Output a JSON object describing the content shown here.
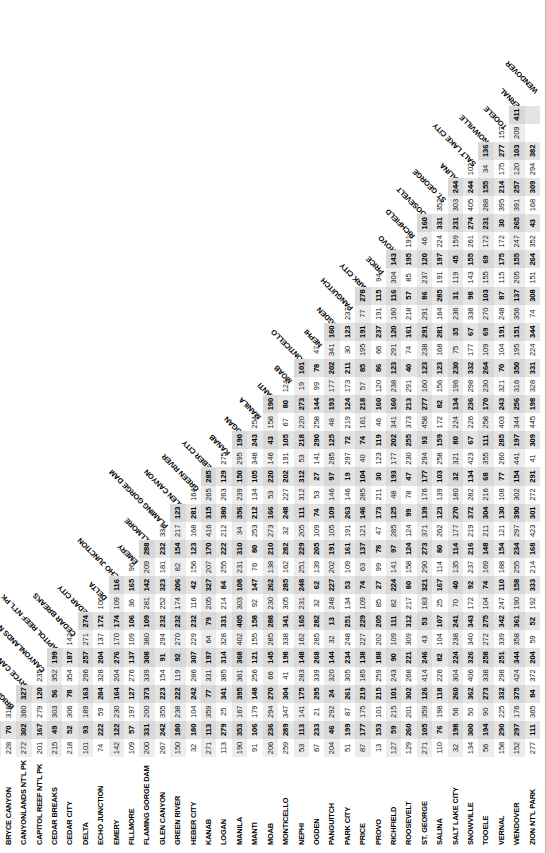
{
  "chart_data": {
    "type": "table",
    "xlabel": "Destination city",
    "ylabel": "Origin city",
    "legend_position": "none",
    "grid": false,
    "note": "Lower-triangular road-mileage matrix between Utah cities and national parks. Column headers are printed diagonally; row headers run down the left edge.",
    "categories": [
      "AMERICAN FORK",
      "BEAVER",
      "BRIGHAM CITY",
      "BRYCE CANYON",
      "CANYONLANDS NT'L PK",
      "CAPITOL REEF NT'L PK",
      "CEDAR BREAKS",
      "CEDAR CITY",
      "DELTA",
      "ECHO JUNCTION",
      "EMERY",
      "FILLMORE",
      "FLAMING GORGE DAM",
      "GLEN CANYON",
      "GREEN RIVER",
      "HEBER CITY",
      "KANAB",
      "LOGAN",
      "MANILA",
      "MANTI",
      "MOAB",
      "MONTICELLO",
      "NEPHI",
      "OGDEN",
      "PANGUITCH",
      "PARK CITY",
      "PRICE",
      "PROVO",
      "RICHFIELD",
      "ROOSEVELT",
      "ST. GEORGE",
      "SALINA",
      "SALT LAKE CITY",
      "SNOWVILLE",
      "TOOELE",
      "VERNAL",
      "WENDOVER",
      "ZION NT'L PARK"
    ],
    "row_labels": [
      "BEAVER",
      "BRIGHAM CITY",
      "BRYCE CANYON",
      "CANYONLANDS NT'L PK",
      "CAPITOL REEF NT'L PK",
      "CEDAR BREAKS",
      "CEDAR CITY",
      "DELTA",
      "ECHO JUNCTION",
      "EMERY",
      "FILLMORE",
      "FLAMING GORGE DAM",
      "GLEN CANYON",
      "GREEN RIVER",
      "HEBER CITY",
      "KANAB",
      "LOGAN",
      "MANILA",
      "MANTI",
      "MOAB",
      "MONTICELLO",
      "NEPHI",
      "OGDEN",
      "PANGUITCH",
      "PARK CITY",
      "PRICE",
      "PROVO",
      "RICHFIELD",
      "ROOSEVELT",
      "ST. GEORGE",
      "SALINA",
      "SALT LAKE CITY",
      "SNOWVILLE",
      "TOOELE",
      "VERNAL",
      "WENDOVER",
      "ZION NT'L PARK"
    ],
    "col_labels": [
      "AMERICAN FORK",
      "BEAVER",
      "BRIGHAM CITY",
      "BRYCE CANYON",
      "CANYONLANDS NT'L PK",
      "CAPITOL REEF NT'L PK",
      "CEDAR BREAKS",
      "CEDAR CITY",
      "DELTA",
      "ECHO JUNCTION",
      "EMERY",
      "FILLMORE",
      "FLAMING GORGE DAM",
      "GLEN CANYON",
      "GREEN RIVER",
      "HEBER CITY",
      "KANAB",
      "LOGAN",
      "MANILA",
      "MANTI",
      "MOAB",
      "MONTICELLO",
      "NEPHI",
      "OGDEN",
      "PANGUITCH",
      "PARK CITY",
      "PRICE",
      "PROVO",
      "RICHFIELD",
      "ROOSEVELT",
      "ST. GEORGE",
      "SALINA",
      "SALT LAKE CITY",
      "SNOWVILLE",
      "TOOELE",
      "VERNAL",
      "WENDOVER"
    ],
    "rows": [
      {
        "label": "BEAVER",
        "values": [
          166
        ]
      },
      {
        "label": "BRIGHAM CITY",
        "values": [
          88,
          254
        ]
      },
      {
        "label": "BRYCE CANYON",
        "values": [
          228,
          70,
          316
        ]
      },
      {
        "label": "CANYONLANDS NT'L PK",
        "values": [
          272,
          302,
          360,
          327,
          235
        ]
      },
      {
        "label": "CAPITOL REEF NT'L PK",
        "values": [
          201,
          167,
          279,
          120,
          235,
          178
        ]
      },
      {
        "label": "CEDAR BREAKS",
        "values": [
          215,
          49,
          303,
          56,
          352,
          199,
          21
        ]
      },
      {
        "label": "CEDAR CITY",
        "values": [
          218,
          52,
          306,
          78,
          354,
          187,
          142,
          133
        ]
      },
      {
        "label": "DELTA",
        "values": [
          101,
          93,
          189,
          163,
          296,
          257,
          271,
          274,
          271
        ]
      },
      {
        "label": "ECHO JUNCTION",
        "values": [
          74,
          222,
          59,
          284,
          328,
          204,
          137,
          172,
          106,
          158
        ]
      },
      {
        "label": "EMERY",
        "values": [
          142,
          122,
          230,
          164,
          204,
          276,
          170,
          174,
          109,
          116,
          198
        ]
      },
      {
        "label": "FILLMORE",
        "values": [
          109,
          57,
          197,
          127,
          276,
          137,
          109,
          106,
          36,
          165,
          96
        ]
      },
      {
        "label": "FLAMING GORGE DAM",
        "values": [
          200,
          331,
          200,
          373,
          339,
          308,
          380,
          109,
          281,
          142,
          209,
          288
        ]
      },
      {
        "label": "GLEN CANYON",
        "values": [
          267,
          242,
          355,
          223,
          154,
          91,
          294,
          232,
          252,
          323,
          181,
          232,
          334
        ]
      },
      {
        "label": "GREEN RIVER",
        "values": [
          150,
          180,
          238,
          222,
          119,
          92,
          270,
          232,
          174,
          206,
          82,
          154,
          217,
          123
        ]
      },
      {
        "label": "HEBER CITY",
        "values": [
          32,
          180,
          104,
          242,
          286,
          307,
          229,
          232,
          116,
          42,
          156,
          123,
          168,
          281,
          164
        ]
      },
      {
        "label": "KANAB",
        "values": [
          271,
          113,
          359,
          77,
          331,
          197,
          64,
          79,
          205,
          327,
          207,
          170,
          416,
          315,
          265,
          285
        ]
      },
      {
        "label": "LOGAN",
        "values": [
          113,
          279,
          25,
          341,
          385,
          314,
          328,
          331,
          214,
          84,
          255,
          222,
          212,
          380,
          263,
          129,
          275
        ]
      },
      {
        "label": "MANILA",
        "values": [
          190,
          353,
          167,
          395,
          361,
          368,
          402,
          405,
          303,
          108,
          231,
          310,
          34,
          356,
          239,
          150,
          295,
          190
        ]
      },
      {
        "label": "MANTI",
        "values": [
          91,
          106,
          179,
          148,
          256,
          121,
          155,
          158,
          92,
          147,
          76,
          80,
          253,
          212,
          134,
          105,
          348,
          243,
          254
        ]
      },
      {
        "label": "MOAB",
        "values": [
          206,
          236,
          294,
          270,
          66,
          145,
          285,
          288,
          230,
          262,
          138,
          210,
          273,
          166,
          53,
          220,
          146,
          43,
          158,
          190
        ]
      },
      {
        "label": "MONTICELLO",
        "values": [
          259,
          289,
          347,
          304,
          41,
          198,
          338,
          341,
          305,
          285,
          162,
          282,
          32,
          248,
          227,
          202,
          191,
          105,
          67,
          80,
          124,
          217
        ]
      },
      {
        "label": "NEPHI",
        "values": [
          53,
          113,
          141,
          175,
          283,
          148,
          162,
          165,
          231,
          248,
          251,
          229,
          205,
          111,
          312,
          312,
          53,
          218,
          220,
          273,
          19,
          101,
          124,
          273
        ]
      },
      {
        "label": "OGDEN",
        "values": [
          67,
          233,
          21,
          295,
          339,
          268,
          285,
          282,
          32,
          62,
          139,
          205,
          109,
          74,
          53,
          27,
          141,
          290,
          258,
          144,
          99,
          78,
          47
        ]
      },
      {
        "label": "PANGUITCH",
        "values": [
          204,
          46,
          292,
          24,
          320,
          144,
          32,
          13,
          248,
          227,
          202,
          191,
          105,
          109,
          146,
          97,
          285,
          125,
          48,
          193,
          177,
          202,
          341,
          160,
          238
        ]
      },
      {
        "label": "PARK CITY",
        "values": [
          51,
          199,
          87,
          261,
          305,
          234,
          248,
          251,
          134,
          53,
          109,
          161,
          191,
          263,
          146,
          19,
          297,
          72,
          219,
          124,
          173,
          211,
          30,
          123,
          237
        ]
      },
      {
        "label": "PRICE",
        "values": [
          87,
          177,
          175,
          219,
          185,
          138,
          227,
          229,
          109,
          74,
          63,
          137,
          121,
          146,
          285,
          104,
          40,
          74,
          161,
          218,
          57,
          85,
          195,
          191,
          77,
          278,
          115
        ]
      },
      {
        "label": "PROVO",
        "values": [
          13,
          153,
          101,
          215,
          259,
          188,
          202,
          205,
          85,
          27,
          99,
          78,
          47,
          173,
          211,
          30,
          123,
          119,
          46,
          160,
          120,
          86,
          66,
          237,
          191,
          115,
          94,
          236,
          249
        ]
      },
      {
        "label": "RICHFIELD",
        "values": [
          127,
          59,
          215,
          101,
          243,
          90,
          109,
          111,
          82,
          224,
          141,
          97,
          285,
          125,
          48,
          193,
          177,
          202,
          341,
          160,
          238,
          123,
          291,
          120,
          160,
          116,
          304,
          143,
          31,
          133,
          65,
          146,
          151,
          308
        ]
      },
      {
        "label": "ROOSEVELT",
        "values": [
          129,
          260,
          201,
          302,
          268,
          221,
          309,
          312,
          217,
          80,
          158,
          124,
          124,
          99,
          78,
          47,
          230,
          255,
          373,
          213,
          291,
          40,
          74,
          161,
          218,
          57,
          85,
          195,
          191,
          77,
          278,
          115,
          94,
          236,
          249,
          308,
          343,
          74
        ]
      },
      {
        "label": "ST. GEORGE",
        "values": [
          271,
          105,
          359,
          126,
          414,
          246,
          43,
          53,
          183,
          321,
          290,
          273,
          371,
          139,
          176,
          177,
          294,
          93,
          458,
          277,
          160,
          123,
          238,
          291,
          291,
          86,
          237,
          120,
          46,
          160,
          116,
          304,
          143,
          31,
          133,
          65,
          146,
          151,
          308
        ]
      },
      {
        "label": "SALINA",
        "values": [
          110,
          76,
          198,
          118,
          226,
          82,
          104,
          107,
          25,
          167,
          114,
          80,
          262,
          123,
          139,
          103,
          258,
          159,
          172,
          82,
          156,
          123,
          168,
          281,
          164,
          285,
          191,
          197,
          224,
          331,
          352,
          151,
          264,
          43,
          168,
          309,
          294
        ]
      },
      {
        "label": "SALT LAKE CITY",
        "values": [
          32,
          198,
          56,
          260,
          304,
          224,
          238,
          241,
          70,
          40,
          135,
          114,
          177,
          270,
          180,
          32,
          321,
          80,
          224,
          134,
          196,
          230,
          75,
          35,
          236,
          31,
          119,
          45,
          159,
          231,
          303,
          244,
          34,
          175,
          120,
          309
        ]
      },
      {
        "label": "SNOWVILLE",
        "values": [
          134,
          300,
          50,
          362,
          406,
          326,
          340,
          343,
          172,
          92,
          237,
          216,
          219,
          372,
          282,
          134,
          423,
          67,
          226,
          236,
          298,
          332,
          177,
          67,
          338,
          98,
          143,
          155,
          261,
          274,
          405,
          244,
          102
        ]
      },
      {
        "label": "TOOELE",
        "values": [
          56,
          194,
          90,
          273,
          338,
          258,
          272,
          275,
          104,
          74,
          169,
          148,
          211,
          304,
          216,
          68,
          355,
          111,
          258,
          170,
          230,
          264,
          109,
          69,
          270,
          103,
          155,
          69,
          172,
          231,
          288,
          155,
          34,
          136
        ]
      },
      {
        "label": "VERNAL",
        "values": [
          158,
          290,
          225,
          332,
          298,
          251,
          339,
          342,
          247,
          110,
          188,
          154,
          121,
          130,
          108,
          77,
          260,
          285,
          403,
          243,
          321,
          70,
          104,
          191,
          248,
          87,
          115,
          175,
          172,
          30,
          395,
          214,
          175,
          277,
          157
        ]
      },
      {
        "label": "WENDOVER",
        "values": [
          152,
          297,
          176,
          375,
          424,
          344,
          358,
          361,
          190,
          158,
          255,
          234,
          297,
          390,
          302,
          154,
          441,
          197,
          344,
          256,
          316,
          350,
          195,
          151,
          356,
          137,
          205,
          155,
          247,
          265,
          391,
          257,
          120,
          103,
          209,
          411
        ]
      },
      {
        "label": "ZION NT'L PARK",
        "values": [
          277,
          111,
          365,
          84,
          372,
          204,
          59,
          52,
          192,
          333,
          214,
          168,
          423,
          301,
          272,
          291,
          41,
          309,
          445,
          198,
          328,
          331,
          224,
          344,
          74,
          308,
          151,
          264,
          352,
          43,
          168,
          309,
          294,
          382
        ]
      }
    ],
    "shaded_rows_note": "Alternating rows and selected columns carry a light grey background band.",
    "colors": {
      "text": "#000000",
      "band": "#ededed",
      "shade": "#e4e4e4",
      "rule": "#b9b9b9",
      "page": "#ffffff"
    }
  }
}
